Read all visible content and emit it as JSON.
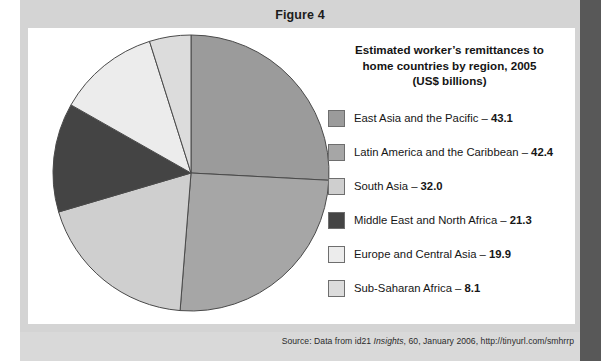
{
  "figure": {
    "label": "Figure 4"
  },
  "chart_title": {
    "line1": "Estimated worker’s remittances to",
    "line2": "home countries by region, 2005",
    "line3": "(US$ billions)"
  },
  "source": {
    "prefix": "Source: Data from id21 ",
    "italic": "Insights",
    "suffix": ", 60, January 2006, http://tinyurl.com/smhrrp"
  },
  "colors": {
    "panel_bg": "#d4d4d4",
    "card_bg": "#ffffff",
    "slice_east_asia": "#9b9b9b",
    "slice_latin_america": "#a6a6a6",
    "slice_south_asia": "#cfcfcf",
    "slice_middle_east": "#444444",
    "slice_europe": "#ececec",
    "slice_sub_saharan": "#dcdcdc",
    "slice_outline": "#4a4a4a"
  },
  "chart_data": {
    "type": "pie",
    "title": "Estimated worker’s remittances to home countries by region, 2005 (US$ billions)",
    "unit": "US$ billions",
    "legend_position": "right",
    "categories": [
      "East Asia and the Pacific",
      "Latin America and the Caribbean",
      "South Asia",
      "Middle East and North Africa",
      "Europe and Central Asia",
      "Sub-Saharan Africa"
    ],
    "values": [
      43.1,
      42.4,
      32.0,
      21.3,
      19.9,
      8.1
    ],
    "total": 166.8,
    "slices": [
      {
        "label": "East Asia and the Pacific",
        "value": 43.1,
        "value_text": "43.1",
        "legend_text": "East Asia and the Pacific – ",
        "color": "#9b9b9b",
        "percent": 25.8
      },
      {
        "label": "Latin America and the Caribbean",
        "value": 42.4,
        "value_text": "42.4",
        "legend_text": "Latin America and the Caribbean – ",
        "color": "#a6a6a6",
        "percent": 25.4
      },
      {
        "label": "South Asia",
        "value": 32.0,
        "value_text": "32.0",
        "legend_text": "South Asia – ",
        "color": "#cfcfcf",
        "percent": 19.2
      },
      {
        "label": "Middle East and North Africa",
        "value": 21.3,
        "value_text": "21.3",
        "legend_text": "Middle East and North Africa – ",
        "color": "#444444",
        "percent": 12.8
      },
      {
        "label": "Europe and Central Asia",
        "value": 19.9,
        "value_text": "19.9",
        "legend_text": "Europe and Central Asia – ",
        "color": "#ececec",
        "percent": 11.9
      },
      {
        "label": "Sub-Saharan Africa",
        "value": 8.1,
        "value_text": "8.1",
        "legend_text": "Sub-Saharan Africa – ",
        "color": "#dcdcdc",
        "percent": 4.9
      }
    ]
  }
}
